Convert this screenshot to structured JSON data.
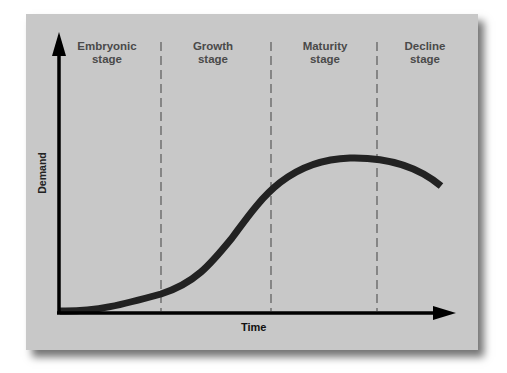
{
  "diagram": {
    "x_axis_label": "Time",
    "y_axis_label": "Demand",
    "stages": [
      {
        "line1": "Embryonic",
        "line2": "stage"
      },
      {
        "line1": "Growth",
        "line2": "stage"
      },
      {
        "line1": "Maturity",
        "line2": "stage"
      },
      {
        "line1": "Decline",
        "line2": "stage"
      }
    ],
    "colors": {
      "panel_background": "#c8c8c8",
      "curve": "#222222",
      "axes": "#000000",
      "stage_text": "#4a4a4a",
      "divider": "#555555"
    }
  }
}
